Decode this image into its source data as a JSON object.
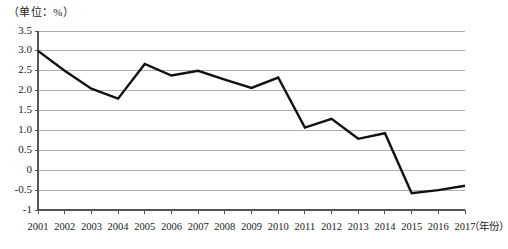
{
  "unit_label": "（单位：%）",
  "chart_data": {
    "type": "line",
    "title": "",
    "subtitle": "",
    "xlabel": "（年份）",
    "ylabel": "（单位：%）",
    "categories": [
      "2001",
      "2002",
      "2003",
      "2004",
      "2005",
      "2006",
      "2007",
      "2008",
      "2009",
      "2010",
      "2011",
      "2012",
      "2013",
      "2014",
      "2015",
      "2016",
      "2017"
    ],
    "values": [
      3.0,
      2.5,
      2.05,
      1.8,
      2.67,
      2.38,
      2.5,
      2.28,
      2.07,
      2.33,
      1.07,
      1.29,
      0.79,
      0.93,
      -0.58,
      -0.5,
      -0.39
    ],
    "series": [
      {
        "name": "",
        "values": [
          3.0,
          2.5,
          2.05,
          1.8,
          2.67,
          2.38,
          2.5,
          2.28,
          2.07,
          2.33,
          1.07,
          1.29,
          0.79,
          0.93,
          -0.58,
          -0.5,
          -0.39
        ]
      }
    ],
    "ylim": [
      -1,
      3.5
    ],
    "yticks": [
      3.5,
      3.0,
      2.5,
      2.0,
      1.5,
      1.0,
      0.5,
      0,
      -0.5,
      -1
    ],
    "ytick_labels": [
      "3.5",
      "3.0",
      "2.5",
      "2.0",
      "1.5",
      "1.0",
      "0.5",
      "0",
      "-0.5",
      "-1"
    ],
    "xtick_labels": [
      "2001",
      "2002",
      "2003",
      "2004",
      "2005",
      "2006",
      "2007",
      "2008",
      "2009",
      "2010",
      "2011",
      "2012",
      "2013",
      "2014",
      "2015",
      "2016",
      "2017"
    ],
    "grid": true,
    "grid_axis": "y",
    "legend": false,
    "legend_position": "none",
    "line_color": "#111111",
    "grid_color": "#9a9a9a",
    "axis_color": "#555555",
    "markers": false,
    "annotations": []
  }
}
